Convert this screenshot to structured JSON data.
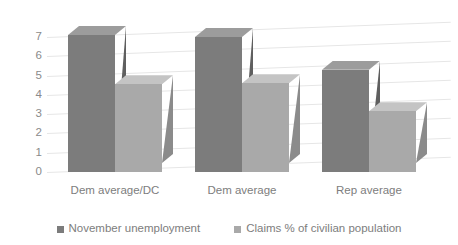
{
  "chart_data": {
    "type": "bar",
    "title": "",
    "subtitle": "",
    "xlabel": "",
    "ylabel": "",
    "categories": [
      "Dem average/DC",
      "Dem average",
      "Rep average"
    ],
    "series": [
      {
        "name": "November unemployment",
        "values": [
          7.1,
          7.0,
          5.3
        ],
        "color": "#7c7c7c"
      },
      {
        "name": "Claims % of civilian population",
        "values": [
          4.55,
          4.6,
          3.15
        ],
        "color": "#a9a9a9"
      }
    ],
    "ylim": [
      0,
      7
    ],
    "yticks": [
      7,
      6,
      5,
      4,
      3,
      2,
      1,
      0
    ],
    "ytick_labels": [
      "7",
      "6",
      "5",
      "4",
      "3",
      "2",
      "1",
      "0"
    ],
    "grid": true,
    "legend_position": "bottom",
    "three_d": true
  },
  "legend": {
    "entries": [
      {
        "label": "November unemployment",
        "marker": "square-swatch-dark"
      },
      {
        "label": "Claims % of civilian population",
        "marker": "square-swatch-light"
      }
    ]
  },
  "colors": {
    "series_dark_front": "#7c7c7c",
    "series_dark_top": "#9c9c9c",
    "series_dark_side": "#5f5f5f",
    "series_light_front": "#a9a9a9",
    "series_light_top": "#c4c4c4",
    "series_light_side": "#8b8b8b",
    "gridline": "#e6e6e6",
    "text": "#7d7d7d",
    "background": "#ffffff"
  }
}
